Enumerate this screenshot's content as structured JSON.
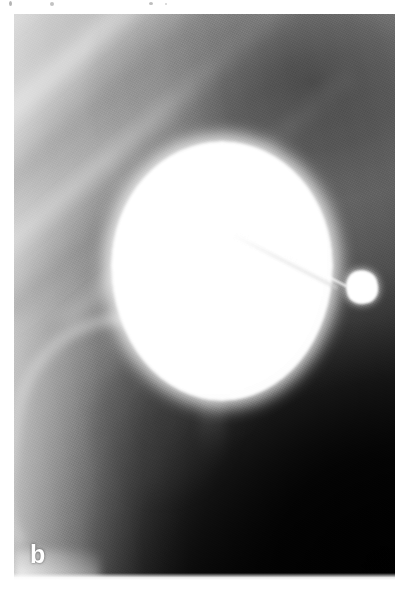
{
  "figure": {
    "panel_label": "b",
    "modality": "radiograph",
    "caption_text": "",
    "plate": {
      "left_px": 14,
      "top_px": 14,
      "width_px": 381,
      "height_px": 566
    }
  },
  "colors": {
    "page_background": "#ffffff",
    "film_light": "#d2d2d2",
    "film_mid": "#757575",
    "film_dark": "#121212",
    "film_black": "#050505",
    "contrast_white": "#ffffff",
    "label_color": "#ffffff"
  },
  "structures": [
    {
      "id": "contrast-sphere",
      "name": "contrast-filled-bladder",
      "label": "",
      "shape": "sphere",
      "center_x": 208,
      "center_y": 257,
      "radius_x": 111,
      "radius_y": 130,
      "brightness": "white"
    },
    {
      "id": "catheter",
      "name": "catheter-tube",
      "label": "",
      "shape": "line",
      "start_x": 238,
      "start_y": 230,
      "end_x": 346,
      "end_y": 285,
      "brightness": "white"
    },
    {
      "id": "tip-balloon",
      "name": "retention-balloon-tip",
      "label": "",
      "shape": "blob",
      "center_x": 362,
      "center_y": 287,
      "radius_x": 16,
      "radius_y": 17,
      "brightness": "white"
    },
    {
      "id": "pelvic-arc",
      "name": "pelvic-bone-arc",
      "label": "",
      "shape": "arc",
      "brightness": "light-gray"
    },
    {
      "id": "urethra",
      "name": "urethral-shadow",
      "label": "",
      "shape": "vertical-band",
      "brightness": "gray"
    },
    {
      "id": "tissue-bands",
      "name": "diagonal-tissue-bands",
      "label": "",
      "shape": "diagonal-bands",
      "brightness": "light-gray"
    }
  ],
  "artifacts": {
    "top_margin_specks": 4
  }
}
